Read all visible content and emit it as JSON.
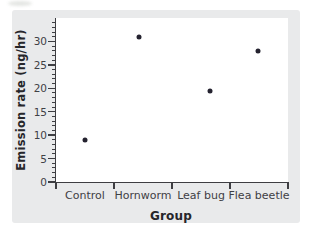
{
  "figure": {
    "page_background": "#ffffff",
    "card_background": "#e9eaeb",
    "plot_background": "#ffffff",
    "axis_color": "#3e3e42",
    "tick_text_color": "#3f4045",
    "axis_title_color": "#26262a",
    "dot_color": "#24222f"
  },
  "chart_data": {
    "type": "scatter",
    "title": "",
    "xlabel": "Group",
    "ylabel": "Emission rate (ng/hr)",
    "categories": [
      "Control",
      "Hornworm",
      "Leaf bug",
      "Flea beetle"
    ],
    "values": [
      9,
      31,
      19.5,
      28
    ],
    "ylim": [
      0,
      35
    ],
    "y_major_ticks": [
      0,
      5,
      10,
      15,
      20,
      25,
      30
    ],
    "y_minor_step": 1,
    "grid": false,
    "legend": null,
    "point_x_offsets_px": [
      0,
      -4,
      9,
      -1
    ]
  }
}
